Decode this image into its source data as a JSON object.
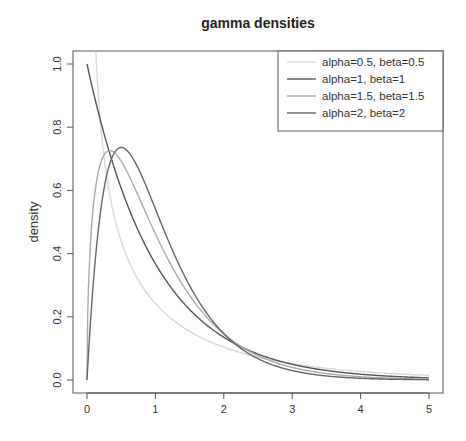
{
  "chart_data": {
    "type": "line",
    "title": "gamma densities",
    "xlabel": "",
    "ylabel": "density",
    "xlim": [
      0,
      5
    ],
    "ylim": [
      0,
      1.0
    ],
    "x_ticks": [
      0,
      1,
      2,
      3,
      4,
      5
    ],
    "x_tick_labels": [
      "0",
      "1",
      "2",
      "3",
      "4",
      "5"
    ],
    "y_ticks": [
      0.0,
      0.2,
      0.4,
      0.6,
      0.8,
      1.0
    ],
    "y_tick_labels": [
      "0.0",
      "0.2",
      "0.4",
      "0.6",
      "0.8",
      "1.0"
    ],
    "grid": false,
    "legend_position": "top-right",
    "series": [
      {
        "name": "alpha=0.5, beta=0.5",
        "alpha": 0.5,
        "beta": 0.5,
        "color": "#d8d8d8",
        "x": [
          0.05,
          0.1,
          0.2,
          0.5,
          1,
          2,
          3,
          4,
          5
        ],
        "values": [
          1.73,
          1.2,
          0.81,
          0.44,
          0.24,
          0.1,
          0.05,
          0.03,
          0.015
        ]
      },
      {
        "name": "alpha=1, beta=1",
        "alpha": 1,
        "beta": 1,
        "color": "#555555",
        "x": [
          0,
          0.5,
          1,
          2,
          3,
          4,
          5
        ],
        "values": [
          1.0,
          0.61,
          0.37,
          0.14,
          0.05,
          0.02,
          0.007
        ]
      },
      {
        "name": "alpha=1.5, beta=1.5",
        "alpha": 1.5,
        "beta": 1.5,
        "color": "#aaaaaa",
        "x": [
          0,
          0.33,
          0.5,
          1,
          2,
          3,
          4,
          5
        ],
        "values": [
          0,
          0.72,
          0.7,
          0.52,
          0.2,
          0.07,
          0.02,
          0.007
        ]
      },
      {
        "name": "alpha=2, beta=2",
        "alpha": 2,
        "beta": 2,
        "color": "#666666",
        "x": [
          0,
          0.25,
          0.5,
          1,
          2,
          3,
          4,
          5
        ],
        "values": [
          0,
          0.61,
          0.74,
          0.54,
          0.15,
          0.03,
          0.005,
          0.001
        ]
      }
    ]
  },
  "plot_area": {
    "left": 73,
    "top": 51,
    "right": 443,
    "bottom": 393,
    "x0_px": 87,
    "x5_px": 429,
    "y0_px": 380,
    "y1_px": 64
  }
}
